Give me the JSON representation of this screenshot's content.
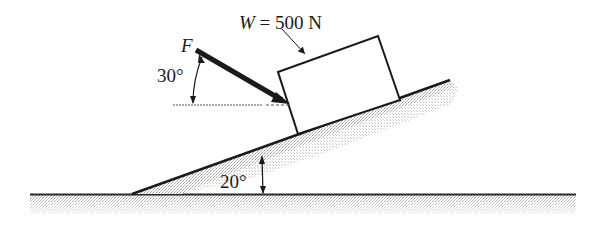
{
  "diagram": {
    "type": "free-body / inclined plane",
    "labels": {
      "weight_symbol": "W",
      "weight_value": "= 500 N",
      "force_symbol": "F",
      "force_angle": "30°",
      "incline_angle": "20°"
    },
    "elements": {
      "incline_angle_deg": 20,
      "force_angle_from_horizontal_deg": 30,
      "weight_newtons": 500
    },
    "colors": {
      "line": "#1a1a1a",
      "hatch": "#9a9a9a",
      "background": "#ffffff"
    }
  }
}
